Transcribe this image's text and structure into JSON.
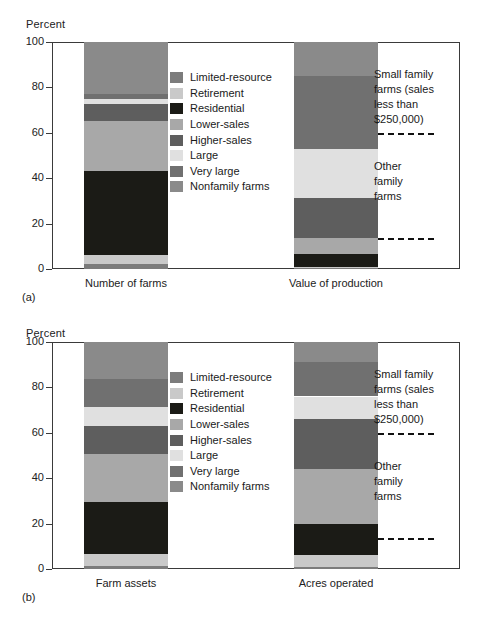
{
  "figure": {
    "axis_title": "Percent",
    "y_ticks": [
      0,
      20,
      40,
      60,
      80,
      100
    ],
    "caption_a": "(a)",
    "caption_b": "(b)",
    "note_small_family": "Small family\nfarms (sales\nless than\n$250,000)",
    "note_other_family": "Other\nfamily\nfarms"
  },
  "legend": {
    "items": [
      {
        "label": "Limited-resource",
        "color": "#7c7c7c"
      },
      {
        "label": "Retirement",
        "color": "#c9c9c9"
      },
      {
        "label": "Residential",
        "color": "#1b1b16"
      },
      {
        "label": "Lower-sales",
        "color": "#a8a8a8"
      },
      {
        "label": "Higher-sales",
        "color": "#5e5e5e"
      },
      {
        "label": "Large",
        "color": "#e0e0e0"
      },
      {
        "label": "Very large",
        "color": "#707070"
      },
      {
        "label": "Nonfamily farms",
        "color": "#8a8a8a"
      }
    ]
  },
  "chart_data": [
    {
      "type": "bar",
      "title": "(a)",
      "ylabel": "Percent",
      "ylim": [
        0,
        100
      ],
      "grid": false,
      "legend_position": "center",
      "stacked": true,
      "categories": [
        "Number of farms",
        "Value of production"
      ],
      "series": [
        {
          "name": "Limited-resource",
          "color": "#7c7c7c",
          "values": [
            2.0,
            0.4
          ]
        },
        {
          "name": "Retirement",
          "color": "#c9c9c9",
          "values": [
            4.0,
            0.5
          ]
        },
        {
          "name": "Residential",
          "color": "#1b1b16",
          "values": [
            37.0,
            5.6
          ]
        },
        {
          "name": "Lower-sales",
          "color": "#a8a8a8",
          "values": [
            22.0,
            7.0
          ]
        },
        {
          "name": "Higher-sales",
          "color": "#5e5e5e",
          "values": [
            7.5,
            18.0
          ]
        },
        {
          "name": "Large",
          "color": "#e0e0e0",
          "values": [
            2.5,
            21.5
          ]
        },
        {
          "name": "Very large",
          "color": "#707070",
          "values": [
            2.0,
            32.0
          ]
        },
        {
          "name": "Nonfamily farms",
          "color": "#8a8a8a",
          "values": [
            23.0,
            15.0
          ]
        }
      ],
      "dashed_markers": [
        60,
        13.5
      ],
      "annotations": [
        "Small family farms (sales less than $250,000)",
        "Other family farms"
      ]
    },
    {
      "type": "bar",
      "title": "(b)",
      "ylabel": "Percent",
      "ylim": [
        0,
        100
      ],
      "grid": false,
      "legend_position": "center",
      "stacked": true,
      "categories": [
        "Farm assets",
        "Acres operated"
      ],
      "series": [
        {
          "name": "Limited-resource",
          "color": "#7c7c7c",
          "values": [
            1.5,
            1.0
          ]
        },
        {
          "name": "Retirement",
          "color": "#c9c9c9",
          "values": [
            5.0,
            5.0
          ]
        },
        {
          "name": "Residential",
          "color": "#1b1b16",
          "values": [
            23.0,
            14.0
          ]
        },
        {
          "name": "Lower-sales",
          "color": "#a8a8a8",
          "values": [
            21.0,
            24.0
          ]
        },
        {
          "name": "Higher-sales",
          "color": "#5e5e5e",
          "values": [
            12.5,
            22.0
          ]
        },
        {
          "name": "Large",
          "color": "#e0e0e0",
          "values": [
            8.5,
            10.0
          ]
        },
        {
          "name": "Very large",
          "color": "#707070",
          "values": [
            12.0,
            15.0
          ]
        },
        {
          "name": "Nonfamily farms",
          "color": "#8a8a8a",
          "values": [
            16.5,
            9.0
          ]
        }
      ],
      "dashed_markers": [
        60,
        13.5
      ],
      "annotations": [
        "Small family farms (sales less than $250,000)",
        "Other family farms"
      ]
    }
  ]
}
